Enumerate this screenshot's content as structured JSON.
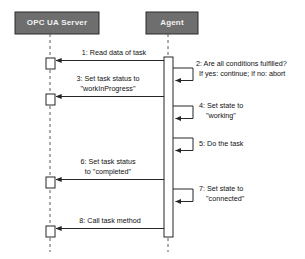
{
  "diagram": {
    "type": "uml-sequence-diagram",
    "background_color": "#ffffff",
    "participant_fill": "#6e6e6e",
    "participant_border": "#2b2b2b",
    "line_color": "#3a3a3a",
    "participants": [
      {
        "id": "opc-ua-server",
        "name": "OPC UA Server"
      },
      {
        "id": "agent",
        "name": "Agent"
      }
    ],
    "messages": [
      {
        "number": "1",
        "text": "1: Read data of task",
        "from": "agent",
        "to": "opc-ua-server",
        "kind": "call",
        "label_lines": [
          "1: Read data of task"
        ]
      },
      {
        "number": "2",
        "text": "2: Are all conditions fulfilled? If yes: continue; if no: abort",
        "from": "agent",
        "to": "agent",
        "kind": "self-call",
        "label_lines": [
          "2: Are all conditions fulfilled?",
          "If yes: continue; if no: abort"
        ]
      },
      {
        "number": "3",
        "text": "3: Set task status to \"workInProgress\"",
        "from": "agent",
        "to": "opc-ua-server",
        "kind": "call",
        "label_lines": [
          "3: Set task status to",
          "\"workInProgress\""
        ]
      },
      {
        "number": "4",
        "text": "4: Set state to \"working\"",
        "from": "agent",
        "to": "agent",
        "kind": "self-call",
        "label_lines": [
          "4: Set state to",
          "\"working\""
        ]
      },
      {
        "number": "5",
        "text": "5: Do the task",
        "from": "agent",
        "to": "agent",
        "kind": "self-call",
        "label_lines": [
          "5: Do the task"
        ]
      },
      {
        "number": "6",
        "text": "6: Set task status to \"completed\"",
        "from": "agent",
        "to": "opc-ua-server",
        "kind": "call",
        "label_lines": [
          "6: Set task status",
          "to \"completed\""
        ]
      },
      {
        "number": "7",
        "text": "7: Set state to \"connected\"",
        "from": "agent",
        "to": "agent",
        "kind": "self-call",
        "label_lines": [
          "7: Set state to",
          "\"connected\""
        ]
      },
      {
        "number": "8",
        "text": "8: Call task method",
        "from": "agent",
        "to": "opc-ua-server",
        "kind": "call",
        "label_lines": [
          "8: Call task method"
        ]
      }
    ],
    "labels": {
      "m1_l1": "1: Read data of task",
      "m2_l1": "2: Are all conditions fulfilled?",
      "m2_l2": "If yes: continue; if no: abort",
      "m3_l1": "3: Set task status to",
      "m3_l2": "\"workInProgress\"",
      "m4_l1": "4: Set state to",
      "m4_l2": "\"working\"",
      "m5_l1": "5: Do the task",
      "m6_l1": "6: Set task status",
      "m6_l2": "to \"completed\"",
      "m7_l1": "7: Set state to",
      "m7_l2": "\"connected\"",
      "m8_l1": "8: Call task method"
    }
  }
}
